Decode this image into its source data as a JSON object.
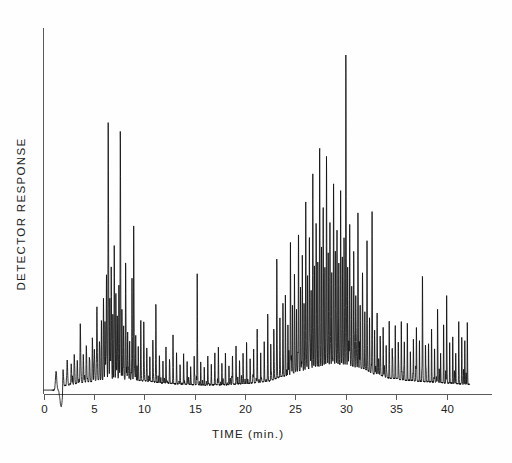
{
  "chart_data": {
    "type": "line",
    "title": "",
    "subtitle": "",
    "xlabel": "TIME (min.)",
    "ylabel": "DETECTOR RESPONSE",
    "xlim": [
      0,
      44.5
    ],
    "ylim": [
      -0.06,
      1.0
    ],
    "grid": false,
    "legend": null,
    "annotations": [],
    "x_ticks": [
      0,
      5,
      10,
      15,
      20,
      25,
      30,
      35,
      40
    ],
    "x_tick_labels": [
      "0",
      "5",
      "10",
      "15",
      "20",
      "25",
      "30",
      "35",
      "40"
    ],
    "y_ticks": [],
    "y_tick_labels": [],
    "series": [
      {
        "name": "Detector signal",
        "trace_start_min": 0.0,
        "trace_end_min": 42.3,
        "solvent_front": {
          "rise_min": 1.25,
          "dip_min": 1.75,
          "dip_depth": -0.055,
          "recover_min": 2.35
        },
        "baseline_nodes": [
          [
            0.0,
            0.012
          ],
          [
            1.2,
            0.013
          ],
          [
            2.4,
            0.028
          ],
          [
            4.0,
            0.036
          ],
          [
            6.0,
            0.044
          ],
          [
            8.0,
            0.046
          ],
          [
            10.0,
            0.04
          ],
          [
            12.0,
            0.034
          ],
          [
            14.0,
            0.03
          ],
          [
            16.0,
            0.028
          ],
          [
            18.0,
            0.029
          ],
          [
            20.0,
            0.032
          ],
          [
            22.0,
            0.038
          ],
          [
            24.0,
            0.055
          ],
          [
            25.5,
            0.07
          ],
          [
            27.0,
            0.082
          ],
          [
            28.5,
            0.09
          ],
          [
            30.0,
            0.088
          ],
          [
            31.5,
            0.078
          ],
          [
            33.0,
            0.06
          ],
          [
            34.5,
            0.048
          ],
          [
            36.0,
            0.042
          ],
          [
            38.0,
            0.038
          ],
          [
            40.0,
            0.034
          ],
          [
            42.3,
            0.03
          ]
        ],
        "peaks": [
          [
            1.95,
            0.05,
            0.055
          ],
          [
            2.35,
            0.075,
            0.05
          ],
          [
            2.75,
            0.062,
            0.045
          ],
          [
            3.05,
            0.09,
            0.042
          ],
          [
            3.35,
            0.07,
            0.04
          ],
          [
            3.65,
            0.175,
            0.045
          ],
          [
            3.95,
            0.082,
            0.04
          ],
          [
            4.25,
            0.11,
            0.042
          ],
          [
            4.55,
            0.074,
            0.038
          ],
          [
            4.85,
            0.13,
            0.04
          ],
          [
            5.05,
            0.085,
            0.036
          ],
          [
            5.3,
            0.215,
            0.042
          ],
          [
            5.55,
            0.115,
            0.038
          ],
          [
            5.75,
            0.16,
            0.038
          ],
          [
            5.95,
            0.24,
            0.04
          ],
          [
            6.1,
            0.18,
            0.035
          ],
          [
            6.25,
            0.3,
            0.038
          ],
          [
            6.42,
            0.76,
            0.04
          ],
          [
            6.58,
            0.25,
            0.034
          ],
          [
            6.72,
            0.33,
            0.036
          ],
          [
            6.88,
            0.2,
            0.032
          ],
          [
            7.02,
            0.395,
            0.036
          ],
          [
            7.18,
            0.265,
            0.034
          ],
          [
            7.32,
            0.18,
            0.032
          ],
          [
            7.48,
            0.29,
            0.034
          ],
          [
            7.62,
            0.715,
            0.038
          ],
          [
            7.78,
            0.215,
            0.033
          ],
          [
            7.95,
            0.16,
            0.032
          ],
          [
            8.15,
            0.35,
            0.036
          ],
          [
            8.35,
            0.14,
            0.032
          ],
          [
            8.55,
            0.115,
            0.03
          ],
          [
            8.78,
            0.3,
            0.034
          ],
          [
            8.95,
            0.455,
            0.036
          ],
          [
            9.15,
            0.135,
            0.03
          ],
          [
            9.4,
            0.105,
            0.03
          ],
          [
            9.65,
            0.15,
            0.03
          ],
          [
            9.95,
            0.18,
            0.03
          ],
          [
            10.25,
            0.095,
            0.028
          ],
          [
            10.55,
            0.075,
            0.028
          ],
          [
            10.85,
            0.125,
            0.028
          ],
          [
            11.15,
            0.23,
            0.03
          ],
          [
            11.5,
            0.085,
            0.026
          ],
          [
            11.85,
            0.065,
            0.026
          ],
          [
            12.15,
            0.11,
            0.028
          ],
          [
            12.5,
            0.07,
            0.026
          ],
          [
            12.85,
            0.14,
            0.028
          ],
          [
            13.2,
            0.08,
            0.026
          ],
          [
            13.55,
            0.06,
            0.026
          ],
          [
            13.9,
            0.095,
            0.026
          ],
          [
            14.25,
            0.07,
            0.026
          ],
          [
            14.6,
            0.055,
            0.024
          ],
          [
            14.95,
            0.085,
            0.026
          ],
          [
            15.25,
            0.325,
            0.03
          ],
          [
            15.6,
            0.07,
            0.024
          ],
          [
            15.95,
            0.055,
            0.024
          ],
          [
            16.3,
            0.09,
            0.026
          ],
          [
            16.65,
            0.06,
            0.024
          ],
          [
            17.0,
            0.075,
            0.024
          ],
          [
            17.35,
            0.11,
            0.026
          ],
          [
            17.7,
            0.065,
            0.024
          ],
          [
            18.05,
            0.095,
            0.026
          ],
          [
            18.4,
            0.06,
            0.024
          ],
          [
            18.75,
            0.085,
            0.026
          ],
          [
            19.1,
            0.115,
            0.026
          ],
          [
            19.45,
            0.07,
            0.024
          ],
          [
            19.8,
            0.09,
            0.026
          ],
          [
            20.15,
            0.125,
            0.026
          ],
          [
            20.5,
            0.075,
            0.024
          ],
          [
            20.85,
            0.1,
            0.026
          ],
          [
            21.2,
            0.16,
            0.028
          ],
          [
            21.55,
            0.085,
            0.024
          ],
          [
            21.9,
            0.12,
            0.026
          ],
          [
            22.25,
            0.195,
            0.028
          ],
          [
            22.55,
            0.11,
            0.026
          ],
          [
            22.85,
            0.15,
            0.028
          ],
          [
            23.15,
            0.33,
            0.032
          ],
          [
            23.45,
            0.135,
            0.026
          ],
          [
            23.75,
            0.185,
            0.028
          ],
          [
            24.0,
            0.24,
            0.03
          ],
          [
            24.25,
            0.15,
            0.028
          ],
          [
            24.5,
            0.395,
            0.032
          ],
          [
            24.7,
            0.215,
            0.028
          ],
          [
            24.9,
            0.29,
            0.03
          ],
          [
            25.1,
            0.185,
            0.028
          ],
          [
            25.3,
            0.42,
            0.032
          ],
          [
            25.5,
            0.25,
            0.028
          ],
          [
            25.68,
            0.34,
            0.03
          ],
          [
            25.85,
            0.205,
            0.028
          ],
          [
            26.02,
            0.52,
            0.032
          ],
          [
            26.2,
            0.29,
            0.03
          ],
          [
            26.38,
            0.405,
            0.03
          ],
          [
            26.55,
            0.235,
            0.028
          ],
          [
            26.72,
            0.56,
            0.032
          ],
          [
            26.88,
            0.3,
            0.03
          ],
          [
            27.05,
            0.43,
            0.032
          ],
          [
            27.22,
            0.255,
            0.028
          ],
          [
            27.4,
            0.67,
            0.034
          ],
          [
            27.58,
            0.32,
            0.03
          ],
          [
            27.75,
            0.48,
            0.032
          ],
          [
            27.92,
            0.27,
            0.028
          ],
          [
            28.08,
            0.615,
            0.034
          ],
          [
            28.25,
            0.34,
            0.03
          ],
          [
            28.42,
            0.44,
            0.032
          ],
          [
            28.6,
            0.285,
            0.028
          ],
          [
            28.78,
            0.555,
            0.034
          ],
          [
            28.95,
            0.33,
            0.03
          ],
          [
            29.12,
            0.4,
            0.03
          ],
          [
            29.3,
            0.26,
            0.028
          ],
          [
            29.48,
            0.52,
            0.032
          ],
          [
            29.65,
            0.31,
            0.03
          ],
          [
            29.82,
            0.375,
            0.03
          ],
          [
            30.0,
            0.94,
            0.036
          ],
          [
            30.18,
            0.29,
            0.03
          ],
          [
            30.38,
            0.42,
            0.032
          ],
          [
            30.58,
            0.245,
            0.028
          ],
          [
            30.78,
            0.34,
            0.03
          ],
          [
            30.98,
            0.21,
            0.028
          ],
          [
            31.2,
            0.46,
            0.032
          ],
          [
            31.42,
            0.195,
            0.028
          ],
          [
            31.65,
            0.285,
            0.03
          ],
          [
            31.88,
            0.17,
            0.028
          ],
          [
            32.1,
            0.33,
            0.03
          ],
          [
            32.35,
            0.15,
            0.026
          ],
          [
            32.6,
            0.48,
            0.032
          ],
          [
            32.85,
            0.135,
            0.026
          ],
          [
            33.1,
            0.19,
            0.028
          ],
          [
            33.4,
            0.115,
            0.026
          ],
          [
            33.7,
            0.155,
            0.026
          ],
          [
            34.0,
            0.1,
            0.026
          ],
          [
            34.3,
            0.17,
            0.028
          ],
          [
            34.6,
            0.095,
            0.026
          ],
          [
            34.9,
            0.14,
            0.026
          ],
          [
            35.2,
            0.115,
            0.026
          ],
          [
            35.5,
            0.18,
            0.028
          ],
          [
            35.8,
            0.105,
            0.026
          ],
          [
            36.1,
            0.15,
            0.026
          ],
          [
            36.4,
            0.09,
            0.024
          ],
          [
            36.7,
            0.13,
            0.026
          ],
          [
            37.0,
            0.165,
            0.028
          ],
          [
            37.3,
            0.1,
            0.024
          ],
          [
            37.6,
            0.32,
            0.03
          ],
          [
            37.9,
            0.115,
            0.026
          ],
          [
            38.2,
            0.09,
            0.024
          ],
          [
            38.5,
            0.14,
            0.026
          ],
          [
            38.8,
            0.105,
            0.024
          ],
          [
            39.1,
            0.23,
            0.028
          ],
          [
            39.4,
            0.095,
            0.024
          ],
          [
            39.7,
            0.15,
            0.026
          ],
          [
            40.0,
            0.275,
            0.028
          ],
          [
            40.3,
            0.085,
            0.024
          ],
          [
            40.6,
            0.12,
            0.026
          ],
          [
            40.9,
            0.095,
            0.024
          ],
          [
            41.2,
            0.165,
            0.026
          ],
          [
            41.5,
            0.11,
            0.024
          ],
          [
            41.8,
            0.135,
            0.026
          ],
          [
            42.05,
            0.19,
            0.026
          ]
        ],
        "noise_amplitude": 0.012,
        "noise_density": 3.4
      }
    ]
  },
  "figure": {
    "background_color": "#fefefe",
    "trace_color": "#0d0d0d",
    "axis_color": "#5a5a5a",
    "text_color": "#222222"
  }
}
